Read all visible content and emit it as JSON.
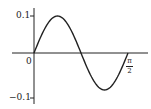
{
  "chart_data": {
    "type": "line",
    "title": "",
    "xlabel": "",
    "ylabel": "",
    "function": "y = 0.1 sin(4x)",
    "x_tick_labels": [
      "0",
      "π/2"
    ],
    "y_tick_labels": [
      "0.1",
      "-0.1"
    ],
    "xlim": [
      0,
      1.5708
    ],
    "ylim": [
      -0.1,
      0.1
    ],
    "grid": false,
    "legend": null,
    "series": [
      {
        "name": "curve",
        "x": [
          0,
          0.1963,
          0.3927,
          0.589,
          0.7854,
          0.9817,
          1.1781,
          1.3744,
          1.5708
        ],
        "y": [
          0,
          0.0707,
          0.1,
          0.0707,
          0,
          -0.0707,
          -0.1,
          -0.0707,
          0
        ]
      }
    ],
    "colors": {
      "line": "#222222",
      "axis": "#222222"
    }
  },
  "labels": {
    "y_top": "0.1",
    "y_bottom": "−0.1",
    "origin": "0",
    "x_end_num": "π",
    "x_end_den": "2"
  }
}
